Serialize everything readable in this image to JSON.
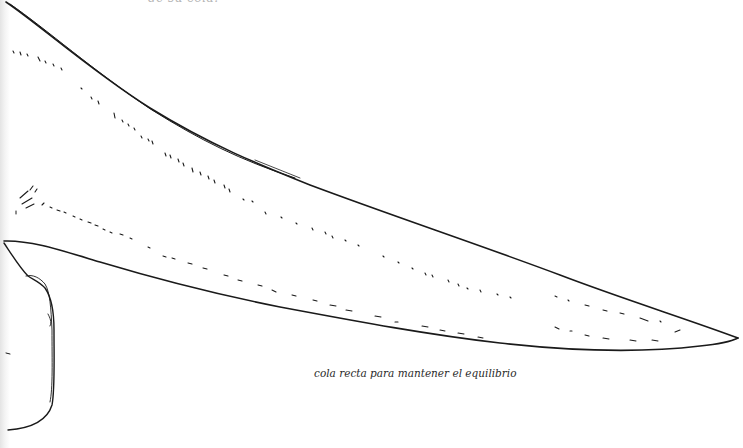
{
  "page": {
    "top_cut_text": "de su cola.",
    "caption": "cola recta para mantener el equilibrio"
  },
  "drawing": {
    "subject": "dinosaur-tail",
    "stroke_color": "#1a1a1a",
    "background": "#ffffff"
  }
}
